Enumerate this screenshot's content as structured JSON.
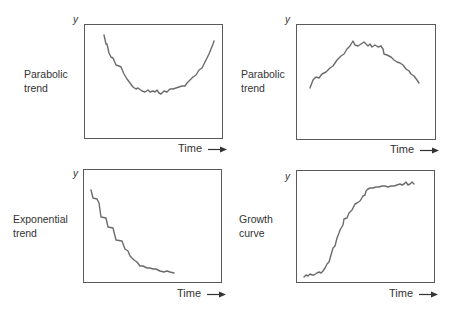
{
  "chart_data": [
    {
      "type": "line",
      "id": "top-left",
      "title": "Parabolic trend",
      "title_lines": [
        "Parabolic",
        "trend"
      ],
      "xlabel": "Time",
      "ylabel": "y",
      "grid": false,
      "box": {
        "left": 84,
        "top": 24,
        "right": 223,
        "bottom": 139
      },
      "description": "U-shaped parabolic trend: decreasing then increasing",
      "points": [
        [
          104,
          35
        ],
        [
          106,
          44
        ],
        [
          107,
          44
        ],
        [
          109,
          53
        ],
        [
          111,
          57
        ],
        [
          113,
          58
        ],
        [
          116,
          65
        ],
        [
          119,
          66
        ],
        [
          121,
          67
        ],
        [
          124,
          74
        ],
        [
          127,
          79
        ],
        [
          130,
          83
        ],
        [
          133,
          87
        ],
        [
          136,
          89
        ],
        [
          138,
          88
        ],
        [
          142,
          91
        ],
        [
          145,
          92
        ],
        [
          148,
          90
        ],
        [
          150,
          92
        ],
        [
          153,
          91
        ],
        [
          155,
          92
        ],
        [
          157,
          90
        ],
        [
          159,
          93
        ],
        [
          161,
          94
        ],
        [
          164,
          91
        ],
        [
          167,
          92
        ],
        [
          170,
          89
        ],
        [
          173,
          89
        ],
        [
          176,
          88
        ],
        [
          179,
          87
        ],
        [
          182,
          86
        ],
        [
          185,
          86
        ],
        [
          187,
          83
        ],
        [
          190,
          80
        ],
        [
          193,
          77
        ],
        [
          196,
          75
        ],
        [
          199,
          70
        ],
        [
          202,
          68
        ],
        [
          205,
          62
        ],
        [
          207,
          58
        ],
        [
          209,
          54
        ],
        [
          211,
          49
        ],
        [
          213,
          44
        ],
        [
          214,
          41
        ]
      ]
    },
    {
      "type": "line",
      "id": "top-right",
      "title": "Parabolic trend",
      "title_lines": [
        "Parabolic",
        "trend"
      ],
      "xlabel": "Time",
      "ylabel": "y",
      "grid": false,
      "box": {
        "left": 296,
        "top": 24,
        "right": 436,
        "bottom": 140
      },
      "description": "Inverted parabolic trend: increasing then decreasing",
      "points": [
        [
          310,
          88
        ],
        [
          313,
          80
        ],
        [
          316,
          77
        ],
        [
          319,
          78
        ],
        [
          322,
          74
        ],
        [
          326,
          72
        ],
        [
          330,
          68
        ],
        [
          333,
          66
        ],
        [
          337,
          60
        ],
        [
          341,
          56
        ],
        [
          344,
          54
        ],
        [
          347,
          49
        ],
        [
          350,
          46
        ],
        [
          353,
          41
        ],
        [
          355,
          45
        ],
        [
          358,
          46
        ],
        [
          361,
          44
        ],
        [
          364,
          42
        ],
        [
          366,
          44
        ],
        [
          368,
          46
        ],
        [
          370,
          44
        ],
        [
          372,
          47
        ],
        [
          375,
          45
        ],
        [
          378,
          47
        ],
        [
          381,
          46
        ],
        [
          383,
          49
        ],
        [
          384,
          54
        ],
        [
          387,
          55
        ],
        [
          391,
          57
        ],
        [
          394,
          60
        ],
        [
          397,
          62
        ],
        [
          400,
          63
        ],
        [
          403,
          65
        ],
        [
          406,
          69
        ],
        [
          409,
          71
        ],
        [
          411,
          74
        ],
        [
          414,
          76
        ],
        [
          417,
          80
        ],
        [
          419,
          83
        ]
      ]
    },
    {
      "type": "line",
      "id": "bottom-left",
      "title": "Exponential trend",
      "title_lines": [
        "Exponential",
        "trend"
      ],
      "xlabel": "Time",
      "ylabel": "y",
      "grid": false,
      "box": {
        "left": 83,
        "top": 169,
        "right": 222,
        "bottom": 283
      },
      "description": "Exponential decay trend: steep decrease flattening out",
      "points": [
        [
          91,
          190
        ],
        [
          93,
          198
        ],
        [
          97,
          199
        ],
        [
          99,
          203
        ],
        [
          101,
          217
        ],
        [
          106,
          218
        ],
        [
          108,
          227
        ],
        [
          113,
          228
        ],
        [
          116,
          240
        ],
        [
          122,
          241
        ],
        [
          125,
          249
        ],
        [
          128,
          251
        ],
        [
          130,
          256
        ],
        [
          134,
          260
        ],
        [
          137,
          262
        ],
        [
          140,
          266
        ],
        [
          143,
          266
        ],
        [
          147,
          268
        ],
        [
          150,
          268
        ],
        [
          153,
          269
        ],
        [
          156,
          269
        ],
        [
          160,
          271
        ],
        [
          164,
          272
        ],
        [
          167,
          271
        ],
        [
          170,
          272
        ],
        [
          174,
          273
        ]
      ]
    },
    {
      "type": "line",
      "id": "bottom-right",
      "title": "Growth curve",
      "title_lines": [
        "Growth",
        "curve"
      ],
      "xlabel": "Time",
      "ylabel": "y",
      "grid": false,
      "box": {
        "left": 296,
        "top": 170,
        "right": 435,
        "bottom": 283
      },
      "description": "S-shaped growth curve: slow start, rapid rise, plateau",
      "points": [
        [
          304,
          277
        ],
        [
          306,
          275
        ],
        [
          308,
          276
        ],
        [
          310,
          274
        ],
        [
          312,
          275
        ],
        [
          314,
          275
        ],
        [
          317,
          273
        ],
        [
          319,
          272
        ],
        [
          321,
          273
        ],
        [
          323,
          271
        ],
        [
          325,
          268
        ],
        [
          327,
          264
        ],
        [
          329,
          262
        ],
        [
          331,
          255
        ],
        [
          333,
          248
        ],
        [
          335,
          246
        ],
        [
          337,
          238
        ],
        [
          339,
          233
        ],
        [
          340,
          230
        ],
        [
          343,
          225
        ],
        [
          344,
          219
        ],
        [
          347,
          218
        ],
        [
          349,
          213
        ],
        [
          352,
          210
        ],
        [
          355,
          204
        ],
        [
          357,
          203
        ],
        [
          360,
          201
        ],
        [
          363,
          196
        ],
        [
          365,
          195
        ],
        [
          366,
          191
        ],
        [
          368,
          189
        ],
        [
          370,
          188
        ],
        [
          373,
          188
        ],
        [
          376,
          187
        ],
        [
          379,
          187
        ],
        [
          382,
          186
        ],
        [
          385,
          186
        ],
        [
          388,
          187
        ],
        [
          391,
          186
        ],
        [
          394,
          186
        ],
        [
          397,
          185
        ],
        [
          400,
          184
        ],
        [
          402,
          185
        ],
        [
          404,
          184
        ],
        [
          406,
          182
        ],
        [
          408,
          185
        ],
        [
          410,
          184
        ],
        [
          412,
          182
        ],
        [
          414,
          184
        ]
      ]
    }
  ],
  "panels": [
    {
      "label_line1": "Parabolic",
      "label_line2": "trend",
      "y_axis": "y",
      "x_axis": "Time",
      "arrow": "arrow-right-icon"
    },
    {
      "label_line1": "Parabolic",
      "label_line2": "trend",
      "y_axis": "y",
      "x_axis": "Time",
      "arrow": "arrow-right-icon"
    },
    {
      "label_line1": "Exponential",
      "label_line2": "trend",
      "y_axis": "y",
      "x_axis": "Time",
      "arrow": "arrow-right-icon"
    },
    {
      "label_line1": "Growth",
      "label_line2": "curve",
      "y_axis": "y",
      "x_axis": "Time",
      "arrow": "arrow-right-icon"
    }
  ],
  "colors": {
    "line": "#6b6b6b",
    "frame": "#5a5a5a",
    "text": "#333333",
    "background": "#ffffff"
  }
}
